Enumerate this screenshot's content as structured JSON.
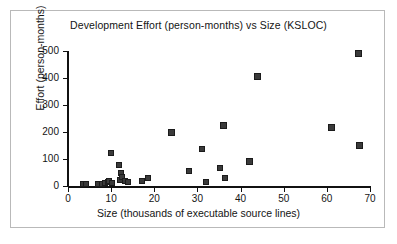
{
  "figure": {
    "title": "Development Effort (person-months)  vs Size (KSLOC)",
    "frame_color": "#b9b9b9",
    "background": "#ffffff"
  },
  "chart_data": {
    "type": "scatter",
    "title": "Development Effort (person-months)  vs Size (KSLOC)",
    "xlabel": "Size (thousands of executable source lines)",
    "ylabel": "Effort (person-months)",
    "xlim": [
      0,
      70
    ],
    "ylim": [
      0,
      500
    ],
    "xticks": [
      0,
      10,
      20,
      30,
      40,
      50,
      60,
      70
    ],
    "yticks": [
      0,
      100,
      200,
      300,
      400,
      500
    ],
    "grid": false,
    "legend": null,
    "marker_style": "filled-square",
    "marker_color": "#3a3a3a",
    "marker_edge_color": "#1b1b1b",
    "points": [
      {
        "x": 3.4,
        "y": 8
      },
      {
        "x": 4.2,
        "y": 8
      },
      {
        "x": 7.0,
        "y": 8
      },
      {
        "x": 7.8,
        "y": 9
      },
      {
        "x": 8.6,
        "y": 10
      },
      {
        "x": 9.2,
        "y": 14
      },
      {
        "x": 9.6,
        "y": 20
      },
      {
        "x": 9.9,
        "y": 121
      },
      {
        "x": 10.3,
        "y": 12
      },
      {
        "x": 11.8,
        "y": 78
      },
      {
        "x": 12.0,
        "y": 24
      },
      {
        "x": 12.4,
        "y": 47
      },
      {
        "x": 12.6,
        "y": 35
      },
      {
        "x": 13.2,
        "y": 18
      },
      {
        "x": 14.0,
        "y": 16
      },
      {
        "x": 17.2,
        "y": 18
      },
      {
        "x": 18.6,
        "y": 31
      },
      {
        "x": 24.0,
        "y": 199
      },
      {
        "x": 28.0,
        "y": 55
      },
      {
        "x": 31.0,
        "y": 137
      },
      {
        "x": 32.0,
        "y": 16
      },
      {
        "x": 35.2,
        "y": 65
      },
      {
        "x": 36.0,
        "y": 225
      },
      {
        "x": 36.3,
        "y": 31
      },
      {
        "x": 42.0,
        "y": 89
      },
      {
        "x": 44.0,
        "y": 407
      },
      {
        "x": 61.0,
        "y": 218
      },
      {
        "x": 67.3,
        "y": 489
      },
      {
        "x": 67.5,
        "y": 151
      }
    ]
  }
}
